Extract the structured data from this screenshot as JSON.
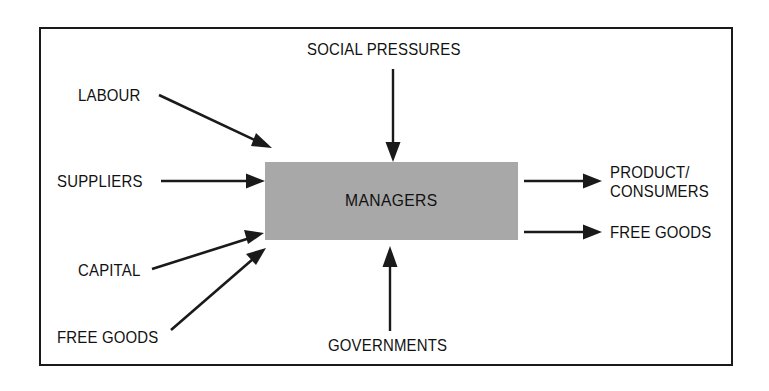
{
  "diagram": {
    "center_node": {
      "label": "MANAGERS",
      "fill_color": "#a8a8a8",
      "text_color": "#111111"
    },
    "frame": {
      "border_color": "#1a1a1a",
      "background_color": "#ffffff"
    },
    "inputs": [
      {
        "id": "social-pressures",
        "label": "SOCIAL PRESSURES",
        "direction": "top-down",
        "arrow": "straight-vertical"
      },
      {
        "id": "labour",
        "label": "LABOUR",
        "direction": "left-diagonal-down",
        "arrow": "diagonal"
      },
      {
        "id": "suppliers",
        "label": "SUPPLIERS",
        "direction": "left-horizontal",
        "arrow": "straight-horizontal"
      },
      {
        "id": "capital",
        "label": "CAPITAL",
        "direction": "left-diagonal-up",
        "arrow": "diagonal"
      },
      {
        "id": "free-goods-in",
        "label": "FREE GOODS",
        "direction": "left-diagonal-up",
        "arrow": "diagonal"
      },
      {
        "id": "governments",
        "label": "GOVERNMENTS",
        "direction": "bottom-up",
        "arrow": "straight-vertical"
      }
    ],
    "outputs": [
      {
        "id": "product-consumers",
        "label": "PRODUCT/\nCONSUMERS",
        "line1": "PRODUCT/",
        "line2": "CONSUMERS",
        "direction": "right-horizontal",
        "arrow": "straight-horizontal"
      },
      {
        "id": "free-goods-out",
        "label": "FREE GOODS",
        "direction": "right-horizontal",
        "arrow": "straight-horizontal"
      }
    ],
    "arrow_color": "#1a1a1a"
  }
}
